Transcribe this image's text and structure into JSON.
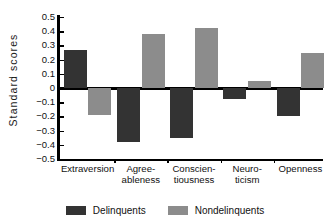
{
  "chart_data": {
    "type": "bar",
    "title": "",
    "xlabel": "",
    "ylabel": "Standard scores",
    "ylim": [
      -0.5,
      0.5
    ],
    "ytick_values": [
      0.5,
      0.4,
      0.3,
      0.2,
      0.1,
      0,
      -0.1,
      -0.2,
      -0.3,
      -0.4,
      -0.5
    ],
    "ytick_labels": [
      "0.5",
      "0.4",
      "0.3",
      "0.2",
      "0.1",
      "0",
      "−0.1",
      "−0.2",
      "−0.3",
      "−0.4",
      "−0.5"
    ],
    "grid": false,
    "legend_position": "bottom",
    "categories": [
      "Extraversion",
      "Agree-ableness",
      "Conscien-tiousness",
      "Neuro-ticism",
      "Openness"
    ],
    "category_lines": [
      [
        "Extraversion",
        ""
      ],
      [
        "Agree-",
        "ableness"
      ],
      [
        "Conscien-",
        "tiousness"
      ],
      [
        "Neuro-",
        "ticism"
      ],
      [
        "Openness",
        ""
      ]
    ],
    "series": [
      {
        "name": "Delinquents",
        "color": "#333333",
        "values": [
          0.27,
          -0.38,
          -0.35,
          -0.08,
          -0.2
        ]
      },
      {
        "name": "Nondelinquents",
        "color": "#8c8c8c",
        "values": [
          -0.19,
          0.38,
          0.42,
          0.05,
          0.25
        ]
      }
    ]
  },
  "legend": {
    "items": [
      {
        "label": "Delinquents",
        "color": "#333333"
      },
      {
        "label": "Nondelinquents",
        "color": "#8c8c8c"
      }
    ]
  },
  "colors": {
    "delinquents": "#333333",
    "nondelinquents": "#8c8c8c",
    "axis": "#000000",
    "background": "#ffffff"
  }
}
